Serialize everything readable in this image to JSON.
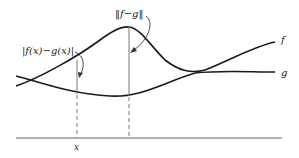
{
  "diagram": {
    "labels": {
      "pointwise_diff": "|f(x)−g(x)|",
      "norm_diff": "‖f−g‖",
      "f_curve": "f",
      "g_curve": "g",
      "x_point": "x"
    },
    "colors": {
      "stroke": "#1a1a1a",
      "axis": "#555555",
      "background": "#ffffff"
    }
  }
}
